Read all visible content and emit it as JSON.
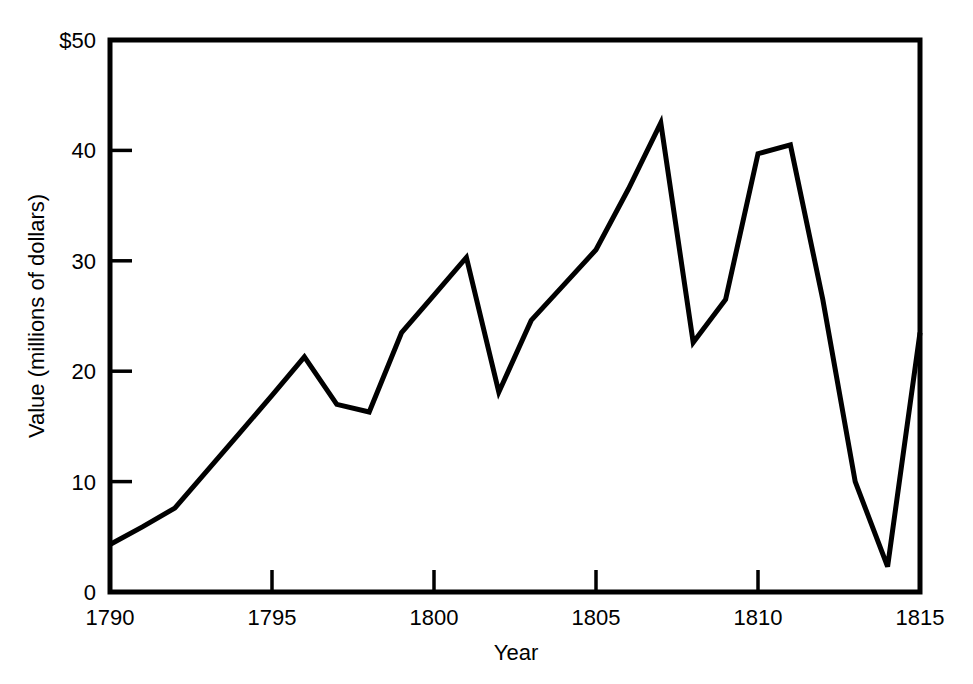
{
  "chart_data": {
    "type": "line",
    "title": "",
    "subtitle": "",
    "xlabel": "Year",
    "ylabel": "Value (millions of dollars)",
    "xlim": [
      1790,
      1815
    ],
    "ylim": [
      0,
      50
    ],
    "xticks": [
      1790,
      1795,
      1800,
      1805,
      1810,
      1815
    ],
    "xtick_labels": [
      "1790",
      "1795",
      "1800",
      "1805",
      "1810",
      "1815"
    ],
    "yticks": [
      0,
      10,
      20,
      30,
      40,
      50
    ],
    "ytick_labels": [
      "0",
      "10",
      "20",
      "30",
      "40",
      "$50"
    ],
    "grid": false,
    "legend": false,
    "legend_position": "none",
    "line_color": "#000000",
    "line_width": 5,
    "axis_color": "#000000",
    "background_color": "#ffffff",
    "series": [
      {
        "name": "Value",
        "x": [
          1790,
          1791,
          1792,
          1793,
          1794,
          1795,
          1796,
          1797,
          1798,
          1799,
          1800,
          1801,
          1802,
          1803,
          1804,
          1805,
          1806,
          1807,
          1808,
          1809,
          1810,
          1811,
          1812,
          1813,
          1814,
          1815
        ],
        "values": [
          4.3,
          5.9,
          7.6,
          11.0,
          14.4,
          17.8,
          21.3,
          17.0,
          16.3,
          23.5,
          26.9,
          30.3,
          18.1,
          24.6,
          27.8,
          31.0,
          36.5,
          42.5,
          22.6,
          26.5,
          39.7,
          40.5,
          26.5,
          10.0,
          2.3,
          23.5
        ]
      }
    ]
  },
  "page": {
    "xlabel": "Year",
    "ylabel": "Value (millions of dollars)"
  }
}
